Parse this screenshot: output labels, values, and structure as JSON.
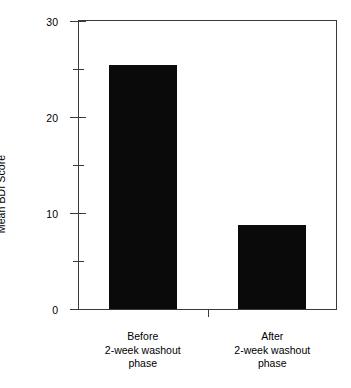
{
  "chart_data": {
    "type": "bar",
    "title": "",
    "subtitle": "",
    "xlabel": "",
    "ylabel": "Mean BDI Score",
    "categories": [
      "Before\n2-week washout\nphase",
      "After\n2-week washout\nphase"
    ],
    "category_lines": [
      [
        "Before",
        "2-week washout",
        "phase"
      ],
      [
        "After",
        "2-week washout",
        "phase"
      ]
    ],
    "values": [
      25.4,
      8.7
    ],
    "ylim": [
      0,
      30
    ],
    "yticks": [
      0,
      10,
      20,
      30
    ],
    "ytick_labels": [
      "0",
      "10",
      "20",
      "30"
    ],
    "yminor_ticks": [
      5,
      15,
      25
    ],
    "grid": false,
    "legend": false,
    "bar_color": "#0a0a0a",
    "axis_color": "#3a3a3a",
    "background": "#ffffff"
  },
  "axis": {
    "y_title": "Mean BDI Score",
    "tick_0": "0",
    "tick_10": "10",
    "tick_20": "20",
    "tick_30": "30"
  },
  "categories": {
    "before": {
      "line1": "Before",
      "line2": "2-week washout",
      "line3": "phase"
    },
    "after": {
      "line1": "After",
      "line2": "2-week washout",
      "line3": "phase"
    }
  }
}
